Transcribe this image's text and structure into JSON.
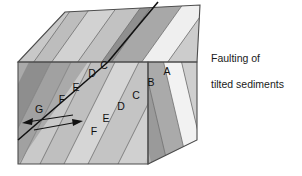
{
  "figure": {
    "caption_line1": "Faulting of",
    "caption_line2": "tilted sediments",
    "caption_full": "Faulting of\ntilted sediments",
    "type": "geologic-block-diagram",
    "subject": "Faulting of tilted sediments"
  },
  "colors": {
    "background": "#ffffff",
    "outline": "#4d4d4d",
    "fault_line": "#111111",
    "label_text": "#111111",
    "caption_text": "#1a1a1a",
    "top_band_1": "#b3b3b3",
    "top_band_2": "#c8c8c8",
    "top_band_3": "#bdbdbd",
    "top_band_4": "#d2d2d2",
    "top_band_5": "#c2c2c2",
    "top_band_6": "#8f8f8f",
    "top_band_7": "#a8a8a8",
    "top_band_8": "#efefef",
    "top_band_9": "#cccccc",
    "front_dark": "#8c8c8c",
    "front_mid": "#b5b5b5",
    "front_light": "#c9c9c9",
    "front_lighter": "#d6d6d6",
    "right_dark": "#9a9a9a",
    "right_mid": "#b0b0b0",
    "right_light": "#cfcfcf",
    "unit_a_fill": "#f2f2f2"
  },
  "units": {
    "front_face": [
      {
        "id": "G",
        "label": "G",
        "x": 39,
        "y": 113
      },
      {
        "id": "F_upper",
        "label": "F",
        "x": 62,
        "y": 103
      },
      {
        "id": "E_upper",
        "label": "E",
        "x": 76,
        "y": 91
      },
      {
        "id": "D_upper",
        "label": "D",
        "x": 92,
        "y": 77
      },
      {
        "id": "C_upper",
        "label": "C",
        "x": 104,
        "y": 69
      },
      {
        "id": "F_lower",
        "label": "F",
        "x": 94,
        "y": 135
      },
      {
        "id": "E_lower",
        "label": "E",
        "x": 106,
        "y": 122
      },
      {
        "id": "D_lower",
        "label": "D",
        "x": 121,
        "y": 110
      },
      {
        "id": "C_lower",
        "label": "C",
        "x": 136,
        "y": 99
      }
    ],
    "right_face": [
      {
        "id": "A",
        "label": "A",
        "x": 167,
        "y": 75
      },
      {
        "id": "B",
        "label": "B",
        "x": 151,
        "y": 86
      }
    ],
    "sequence": [
      "A",
      "B",
      "C",
      "D",
      "E",
      "F",
      "G"
    ],
    "note": "A is youngest (top of tilted sequence), G is oldest"
  },
  "fault": {
    "name": "strike-slip fault trace",
    "arrow_upper_direction": "left",
    "arrow_lower_direction": "right",
    "sense": "offset across fault"
  }
}
